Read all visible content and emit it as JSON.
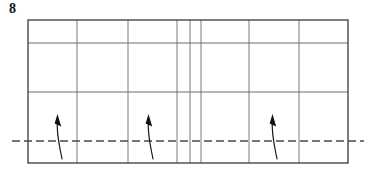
{
  "figure": {
    "label": "8",
    "label_name": "figure-number-8",
    "type": "technical-line-diagram",
    "background_color": "#ffffff",
    "ink_color": "#3a3a3a",
    "arrow_color": "#111111",
    "grid_color": "#6e6e6e",
    "datum_color": "#4a4a4a"
  },
  "frame": {
    "name": "outer-rectangle",
    "x": 28,
    "y": 20,
    "width": 320,
    "height": 143,
    "stroke_width": 1.3,
    "color": "#3a3a3a"
  },
  "horizontal_lines": [
    {
      "name": "upper-horizontal-rule",
      "y": 43,
      "x1": 28,
      "x2": 348,
      "stroke_width": 1.0,
      "color": "#6e6e6e"
    },
    {
      "name": "middle-horizontal-rule",
      "y": 92,
      "x1": 28,
      "x2": 348,
      "stroke_width": 1.0,
      "color": "#6e6e6e"
    }
  ],
  "vertical_lines": [
    {
      "name": "vertical-rule-1",
      "x": 77,
      "y1": 20,
      "y2": 163,
      "stroke_width": 1.0,
      "color": "#7b7b7b"
    },
    {
      "name": "vertical-rule-2",
      "x": 128,
      "y1": 20,
      "y2": 163,
      "stroke_width": 1.0,
      "color": "#7b7b7b"
    },
    {
      "name": "vertical-rule-3",
      "x": 177,
      "y1": 20,
      "y2": 163,
      "stroke_width": 1.0,
      "color": "#7b7b7b"
    },
    {
      "name": "vertical-rule-4",
      "x": 190,
      "y1": 20,
      "y2": 163,
      "stroke_width": 1.0,
      "color": "#7b7b7b"
    },
    {
      "name": "vertical-rule-5",
      "x": 201,
      "y1": 20,
      "y2": 163,
      "stroke_width": 1.0,
      "color": "#7b7b7b"
    },
    {
      "name": "vertical-rule-6",
      "x": 249,
      "y1": 20,
      "y2": 163,
      "stroke_width": 1.0,
      "color": "#7b7b7b"
    },
    {
      "name": "vertical-rule-7",
      "x": 299,
      "y1": 20,
      "y2": 163,
      "stroke_width": 1.0,
      "color": "#7b7b7b"
    }
  ],
  "datum_line": {
    "name": "dashed-datum-line",
    "y": 141,
    "x1": 12,
    "x2": 364,
    "stroke_width": 1.5,
    "dash_pattern": "8 4",
    "color": "#4a4a4a"
  },
  "arrows": [
    {
      "name": "callout-arrow-left",
      "tip_x": 57,
      "tip_y": 116,
      "tail_x": 62,
      "tail_y": 159,
      "path": "M62,159 C59.5,146 56,133 57.5,120",
      "head_path": "M57.5,114 L61.2,126.5 L54.6,123.4 Z"
    },
    {
      "name": "callout-arrow-center",
      "tip_x": 148,
      "tip_y": 116,
      "tail_x": 153,
      "tail_y": 159,
      "path": "M153,159 C150.5,146 147,133 148.5,120",
      "head_path": "M148.5,114 L152.2,126.5 L145.6,123.4 Z"
    },
    {
      "name": "callout-arrow-right",
      "tip_x": 272,
      "tip_y": 116,
      "tail_x": 277,
      "tail_y": 159,
      "path": "M277,159 C274.5,146 271,133 272.5,120",
      "head_path": "M272.5,114 L276.2,126.5 L269.6,123.4 Z"
    }
  ]
}
